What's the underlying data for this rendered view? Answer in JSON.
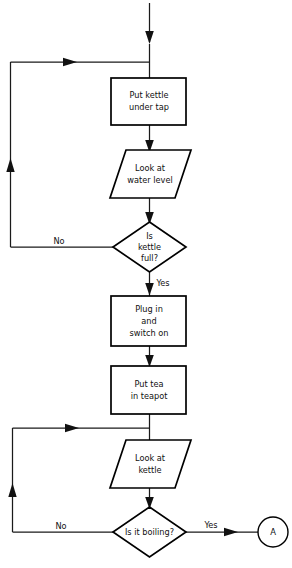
{
  "diagram": {
    "type": "flowchart",
    "background_color": "#ffffff",
    "line_color": "#1a1a1a",
    "shape_stroke_color": "#000000",
    "text_color": "#111111"
  },
  "nodes": [
    {
      "id": "put-kettle-under-tap",
      "shape": "process",
      "lines": [
        "Put kettle",
        "under tap"
      ]
    },
    {
      "id": "look-at-water-level",
      "shape": "input-output",
      "lines": [
        "Look at",
        "water level"
      ]
    },
    {
      "id": "is-kettle-full",
      "shape": "decision",
      "lines": [
        "Is",
        "kettle",
        "full?"
      ]
    },
    {
      "id": "plug-in-and-switch-on",
      "shape": "process",
      "lines": [
        "Plug in",
        "and",
        "switch on"
      ]
    },
    {
      "id": "put-tea-in-teapot",
      "shape": "process",
      "lines": [
        "Put tea",
        "in teapot"
      ]
    },
    {
      "id": "look-at-kettle",
      "shape": "input-output",
      "lines": [
        "Look at",
        "kettle"
      ]
    },
    {
      "id": "is-it-boiling",
      "shape": "decision",
      "lines": [
        "Is it boiling?"
      ]
    },
    {
      "id": "connector-a",
      "shape": "connector",
      "lines": [
        "A"
      ]
    }
  ],
  "branch_labels": {
    "kettle_full_no": "No",
    "kettle_full_yes": "Yes",
    "boiling_no": "No",
    "boiling_yes": "Yes"
  },
  "node_text": {
    "put_kettle_l1": "Put kettle",
    "put_kettle_l2": "under tap",
    "look_water_l1": "Look at",
    "look_water_l2": "water level",
    "kettle_full_l1": "Is",
    "kettle_full_l2": "kettle",
    "kettle_full_l3": "full?",
    "plug_in_l1": "Plug in",
    "plug_in_l2": "and",
    "plug_in_l3": "switch on",
    "put_tea_l1": "Put tea",
    "put_tea_l2": "in teapot",
    "look_kettle_l1": "Look at",
    "look_kettle_l2": "kettle",
    "boiling_l1": "Is it boiling?",
    "connector_a": "A"
  }
}
